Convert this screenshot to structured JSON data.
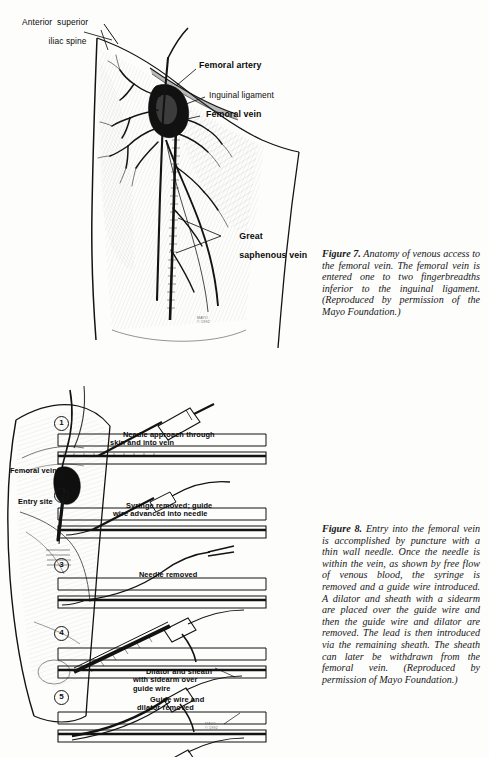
{
  "page": {
    "background": "#fdfdfc",
    "ink": "#131313"
  },
  "figure7": {
    "id": "figure-7",
    "labels": [
      {
        "name": "anterior-superior-iliac-spine",
        "line1": "Anterior  superior",
        "line2": "iliac spine",
        "bold": false
      },
      {
        "name": "femoral-artery",
        "text": "Femoral artery",
        "bold": true
      },
      {
        "name": "inguinal-ligament",
        "text": "Inguinal ligament",
        "bold": false
      },
      {
        "name": "femoral-vein",
        "text": "Femoral vein",
        "bold": true
      },
      {
        "name": "great-saphenous-vein",
        "line1": "Great",
        "line2": "saphenous vein",
        "bold": true
      }
    ],
    "artist_signature": "MAYO\n© 1992",
    "caption": {
      "lead": "Figure 7.",
      "body": "Anatomy of venous access to the femoral vein. The femoral vein is entered one to two fingerbreadths inferior to the inguinal ligament. (Reproduced by permission of the Mayo Foundation.)"
    }
  },
  "figure8": {
    "id": "figure-8",
    "labels": [
      {
        "name": "femoral-vein",
        "text": "Femoral vein"
      },
      {
        "name": "entry-site",
        "text": "Entry site"
      }
    ],
    "steps": [
      {
        "number": "1",
        "line1": "Needle approach through",
        "line2": "skin and into vein",
        "line3": ""
      },
      {
        "number": "2",
        "line1": "Syringe removed; guide",
        "line2": "wire advanced into needle",
        "line3": ""
      },
      {
        "number": "3",
        "line1": "Needle removed",
        "line2": "",
        "line3": ""
      },
      {
        "number": "4",
        "line1": "Dilator and sheath",
        "line2": "with sidearm over",
        "line3": "guide wire"
      },
      {
        "number": "5",
        "line1": "Guide wire and",
        "line2": "dilator removed",
        "line3": ""
      },
      {
        "number": "6",
        "line1": "Lead advanced",
        "line2": "into sheath",
        "line3": ""
      }
    ],
    "artist_signature": "MAYO\n© 1992",
    "caption": {
      "lead": "Figure 8.",
      "body": "Entry into the femoral vein is accomplished by puncture with a thin wall needle. Once the needle is within the vein, as shown by free flow of venous blood, the syringe is removed and a guide wire introduced. A dilator and sheath with a sidearm are placed over the guide wire and then the guide wire and dilator are removed. The lead is then introduced via the remaining sheath. The sheath can later be withdrawn from the femoral vein. (Reproduced by permission of Mayo Foundation.)"
    }
  }
}
